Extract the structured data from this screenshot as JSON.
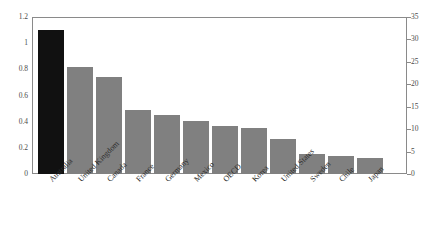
{
  "chart_data": {
    "type": "bar",
    "title": "",
    "subtitle": "",
    "xlabel": "",
    "ylabel": "",
    "categories": [
      "Australia",
      "United Kingdom",
      "Canada",
      "France",
      "Germany",
      "Mexico",
      "OECD",
      "Korea",
      "United States",
      "Sweden",
      "Chile",
      "Japan"
    ],
    "values": [
      1.1,
      0.82,
      0.745,
      0.49,
      0.45,
      0.405,
      0.37,
      0.355,
      0.27,
      0.15,
      0.135,
      0.12
    ],
    "highlight_index": 0,
    "highlight_category": "Australia",
    "ylim": [
      0,
      1.2
    ],
    "yticks": [
      "0",
      "0.2",
      "0.4",
      "0.6",
      "0.8",
      "1",
      "1.2"
    ],
    "ylim_right": [
      0,
      35
    ],
    "yticks_right": [
      "0",
      "5",
      "10",
      "15",
      "20",
      "25",
      "30",
      "35"
    ],
    "grid": false,
    "legend": null,
    "bar_color": "#808080",
    "highlight_color": "#111111",
    "axis_color": "#8a8a8a",
    "background": "#ffffff"
  }
}
